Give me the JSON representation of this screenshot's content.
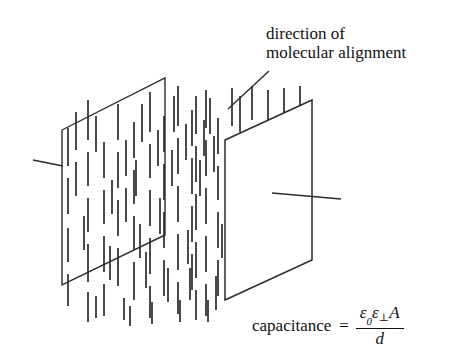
{
  "figure": {
    "stroke_color": "#2b2b2b",
    "background_color": "#ffffff"
  },
  "annotation": {
    "line1": "direction of",
    "line2": "molecular alignment",
    "leader_line": {
      "x1": 228,
      "y1": 109,
      "x2": 269,
      "y2": 71
    }
  },
  "formula": {
    "label": "capacitance",
    "equals": "=",
    "numerator": "ε0ε⊥A",
    "numerator_eps": "ε",
    "numerator_zero": "0",
    "numerator_eps2": "ε",
    "numerator_perp": "⊥",
    "numerator_area": "A",
    "denominator": "d"
  },
  "plates": {
    "back_plate": {
      "name": "back-capacitor-plate",
      "points": "62,130 165,78 165,235 62,285"
    },
    "front_plate": {
      "name": "front-capacitor-plate",
      "points": "225,140 312,100 312,260 225,300"
    },
    "back_lead": {
      "x1": 33,
      "y1": 160,
      "x2": 63,
      "y2": 166
    },
    "front_lead": {
      "x1": 272,
      "y1": 193,
      "x2": 341,
      "y2": 199
    }
  },
  "molecules": {
    "description": "short vertical dashes representing aligned dielectric molecules",
    "count": 96,
    "dashes": [
      [
        68,
        178,
        68,
        214
      ],
      [
        68,
        228,
        68,
        262
      ],
      [
        68,
        274,
        68,
        306
      ],
      [
        68,
        128,
        68,
        166
      ],
      [
        88,
        100,
        88,
        140
      ],
      [
        88,
        152,
        88,
        186
      ],
      [
        88,
        198,
        88,
        232
      ],
      [
        88,
        244,
        88,
        282
      ],
      [
        88,
        292,
        88,
        322
      ],
      [
        104,
        142,
        104,
        178
      ],
      [
        104,
        190,
        104,
        224
      ],
      [
        104,
        236,
        104,
        272
      ],
      [
        104,
        284,
        104,
        316
      ],
      [
        118,
        104,
        118,
        140
      ],
      [
        118,
        152,
        118,
        188
      ],
      [
        118,
        200,
        118,
        236
      ],
      [
        118,
        248,
        118,
        286
      ],
      [
        134,
        122,
        134,
        158
      ],
      [
        134,
        170,
        134,
        204
      ],
      [
        134,
        216,
        134,
        250
      ],
      [
        134,
        262,
        134,
        300
      ],
      [
        136,
        160,
        136,
        196
      ],
      [
        150,
        92,
        150,
        132
      ],
      [
        150,
        144,
        150,
        178
      ],
      [
        150,
        190,
        150,
        226
      ],
      [
        150,
        238,
        150,
        274
      ],
      [
        150,
        286,
        150,
        318
      ],
      [
        164,
        116,
        164,
        152
      ],
      [
        164,
        164,
        164,
        200
      ],
      [
        164,
        212,
        164,
        248
      ],
      [
        164,
        260,
        164,
        296
      ],
      [
        178,
        86,
        178,
        126
      ],
      [
        178,
        138,
        178,
        174
      ],
      [
        178,
        186,
        178,
        222
      ],
      [
        178,
        234,
        178,
        270
      ],
      [
        178,
        282,
        178,
        314
      ],
      [
        192,
        110,
        192,
        146
      ],
      [
        192,
        158,
        192,
        194
      ],
      [
        192,
        206,
        192,
        242
      ],
      [
        192,
        254,
        192,
        290
      ],
      [
        206,
        90,
        206,
        128
      ],
      [
        206,
        140,
        206,
        176
      ],
      [
        206,
        188,
        206,
        224
      ],
      [
        206,
        236,
        206,
        272
      ],
      [
        206,
        284,
        206,
        316
      ],
      [
        218,
        118,
        218,
        154
      ],
      [
        218,
        166,
        218,
        200
      ],
      [
        218,
        212,
        218,
        248
      ],
      [
        218,
        260,
        218,
        296
      ],
      [
        232,
        88,
        232,
        126
      ],
      [
        232,
        138,
        232,
        172
      ],
      [
        232,
        184,
        232,
        218
      ],
      [
        240,
        96,
        240,
        132
      ],
      [
        252,
        86,
        252,
        120
      ],
      [
        268,
        90,
        268,
        124
      ],
      [
        284,
        88,
        284,
        122
      ],
      [
        300,
        86,
        300,
        120
      ],
      [
        196,
        96,
        196,
        134
      ],
      [
        196,
        146,
        196,
        182
      ],
      [
        196,
        194,
        196,
        230
      ],
      [
        196,
        242,
        196,
        278
      ],
      [
        196,
        290,
        196,
        320
      ],
      [
        210,
        98,
        210,
        134
      ],
      [
        76,
        112,
        76,
        150
      ],
      [
        76,
        162,
        76,
        196
      ],
      [
        96,
        116,
        96,
        152
      ],
      [
        112,
        180,
        112,
        214
      ],
      [
        126,
        140,
        126,
        176
      ],
      [
        126,
        188,
        126,
        222
      ],
      [
        142,
        104,
        142,
        142
      ],
      [
        158,
        130,
        158,
        166
      ],
      [
        172,
        150,
        172,
        186
      ],
      [
        186,
        124,
        186,
        160
      ],
      [
        200,
        160,
        200,
        196
      ],
      [
        214,
        136,
        214,
        172
      ],
      [
        228,
        156,
        228,
        192
      ],
      [
        222,
        224,
        222,
        258
      ],
      [
        208,
        300,
        208,
        322
      ],
      [
        180,
        300,
        180,
        322
      ],
      [
        152,
        302,
        152,
        324
      ],
      [
        124,
        298,
        124,
        320
      ],
      [
        96,
        296,
        96,
        318
      ],
      [
        236,
        200,
        236,
        234
      ],
      [
        244,
        150,
        244,
        186
      ],
      [
        84,
        216,
        84,
        250
      ],
      [
        110,
        246,
        110,
        280
      ],
      [
        140,
        224,
        140,
        258
      ],
      [
        168,
        268,
        168,
        302
      ],
      [
        190,
        268,
        190,
        300
      ],
      [
        204,
        120,
        204,
        156
      ],
      [
        160,
        198,
        160,
        234
      ],
      [
        146,
        252,
        146,
        288
      ],
      [
        130,
        306,
        130,
        326
      ],
      [
        174,
        96,
        174,
        132
      ],
      [
        188,
        230,
        188,
        264
      ],
      [
        216,
        276,
        216,
        310
      ],
      [
        230,
        246,
        230,
        280
      ]
    ]
  }
}
